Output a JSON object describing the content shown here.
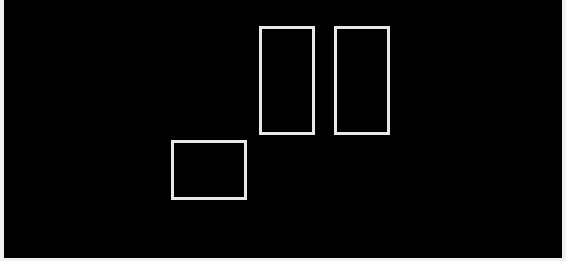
{
  "canvas": {
    "background": "#000000",
    "margin_color": "#f0f0f0"
  },
  "shapes": [
    {
      "id": "rect-lower-left",
      "type": "rectangle-outline",
      "x": 167,
      "y": 140,
      "width": 76,
      "height": 60,
      "stroke": "#e8e8e8",
      "stroke_width": 3
    },
    {
      "id": "rect-tall-left",
      "type": "rectangle-outline",
      "x": 255,
      "y": 26,
      "width": 56,
      "height": 109,
      "stroke": "#e8e8e8",
      "stroke_width": 3
    },
    {
      "id": "rect-tall-right",
      "type": "rectangle-outline",
      "x": 330,
      "y": 26,
      "width": 56,
      "height": 109,
      "stroke": "#e8e8e8",
      "stroke_width": 3
    }
  ]
}
